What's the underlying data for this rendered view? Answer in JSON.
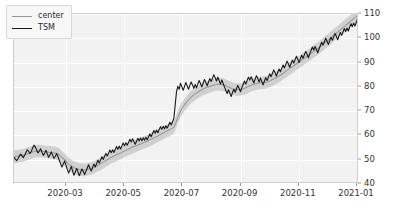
{
  "chart_data": {
    "type": "line",
    "title": "",
    "xlabel": "",
    "ylabel": "",
    "ylim": [
      40,
      110
    ],
    "yticks": [
      40,
      50,
      60,
      70,
      80,
      90,
      100,
      110
    ],
    "xticks": [
      "2020-03",
      "2020-05",
      "2020-07",
      "2020-09",
      "2020-11",
      "2021-01"
    ],
    "grid": true,
    "legend_position": "upper left",
    "legend": [
      "center",
      "TSM"
    ],
    "colors": {
      "center_line": "#9a9a9a",
      "series_line": "#1a1a1a",
      "band_fill": "#b4b4b4",
      "plot_background": "#f2f2f2",
      "grid_line": "#ffffff",
      "figure_background": "#ffffff"
    },
    "x_range": [
      "2020-01-27",
      "2021-01-20"
    ],
    "series": [
      {
        "name": "TSM",
        "values": [
          51.0,
          50.2,
          49.6,
          50.4,
          51.5,
          52.3,
          51.6,
          50.8,
          51.9,
          53.0,
          54.1,
          53.4,
          52.6,
          53.5,
          54.8,
          56.0,
          55.2,
          54.0,
          52.8,
          53.6,
          54.5,
          53.1,
          51.8,
          52.6,
          53.9,
          52.4,
          51.0,
          52.0,
          53.2,
          51.9,
          50.6,
          51.4,
          52.5,
          51.2,
          49.8,
          48.4,
          47.0,
          48.2,
          49.5,
          47.8,
          46.0,
          44.5,
          45.8,
          47.2,
          45.4,
          43.6,
          44.9,
          46.4,
          45.0,
          43.4,
          44.8,
          46.2,
          45.1,
          43.9,
          45.2,
          46.6,
          47.9,
          46.5,
          45.3,
          46.8,
          48.2,
          47.0,
          48.4,
          49.8,
          48.6,
          49.9,
          51.2,
          50.1,
          51.4,
          52.6,
          51.5,
          52.8,
          54.0,
          52.9,
          54.1,
          53.0,
          54.2,
          55.4,
          54.3,
          55.6,
          54.4,
          55.7,
          56.9,
          55.8,
          57.0,
          56.0,
          57.2,
          58.4,
          57.3,
          58.6,
          57.5,
          56.4,
          57.6,
          58.8,
          57.7,
          58.9,
          57.8,
          59.0,
          58.0,
          59.2,
          58.2,
          59.4,
          60.6,
          59.5,
          60.8,
          62.0,
          60.9,
          62.2,
          61.1,
          62.4,
          63.6,
          62.5,
          63.8,
          62.7,
          64.0,
          63.0,
          64.2,
          65.4,
          64.3,
          65.6,
          67.0,
          72.5,
          78.0,
          80.2,
          79.0,
          81.5,
          80.0,
          78.6,
          80.1,
          81.8,
          80.4,
          79.0,
          80.6,
          82.0,
          80.8,
          79.4,
          81.0,
          79.6,
          81.2,
          82.6,
          81.4,
          80.0,
          81.6,
          83.0,
          81.8,
          80.4,
          82.0,
          83.4,
          82.2,
          83.6,
          85.0,
          83.8,
          82.4,
          84.0,
          82.6,
          81.2,
          82.8,
          81.4,
          80.0,
          78.6,
          77.2,
          78.8,
          77.4,
          76.0,
          77.6,
          79.0,
          77.8,
          79.2,
          80.6,
          79.4,
          78.0,
          79.6,
          81.0,
          82.4,
          81.2,
          82.6,
          84.0,
          82.8,
          84.2,
          83.0,
          81.6,
          83.2,
          84.6,
          83.4,
          82.0,
          83.6,
          82.2,
          80.8,
          82.4,
          83.8,
          82.6,
          84.0,
          85.4,
          84.2,
          85.6,
          87.0,
          85.8,
          84.4,
          86.0,
          87.4,
          86.2,
          87.6,
          89.0,
          87.8,
          89.2,
          90.6,
          89.4,
          88.0,
          89.6,
          91.0,
          89.8,
          91.2,
          92.6,
          91.4,
          90.0,
          91.6,
          93.0,
          91.8,
          93.2,
          94.6,
          93.4,
          92.0,
          93.6,
          95.0,
          96.4,
          95.2,
          96.6,
          95.4,
          94.0,
          95.6,
          97.0,
          98.4,
          97.2,
          98.6,
          100.0,
          98.8,
          97.4,
          99.0,
          100.4,
          99.2,
          100.6,
          102.0,
          100.8,
          99.4,
          101.0,
          102.4,
          101.2,
          102.6,
          104.0,
          102.8,
          104.2,
          103.0,
          104.6,
          106.0,
          104.8,
          106.2,
          105.0,
          106.6,
          108.0,
          109.2
        ]
      },
      {
        "name": "center",
        "values": [
          51.2,
          51.3,
          51.4,
          51.5,
          51.6,
          51.7,
          51.8,
          51.9,
          52.0,
          52.2,
          52.4,
          52.6,
          52.8,
          53.0,
          53.2,
          53.4,
          53.5,
          53.6,
          53.6,
          53.6,
          53.6,
          53.5,
          53.4,
          53.3,
          53.3,
          53.2,
          53.1,
          53.0,
          53.0,
          52.9,
          52.8,
          52.7,
          52.6,
          52.4,
          52.0,
          51.5,
          51.0,
          50.5,
          50.0,
          49.4,
          48.8,
          48.2,
          47.8,
          47.5,
          47.1,
          46.7,
          46.5,
          46.4,
          46.2,
          46.0,
          45.9,
          45.9,
          45.8,
          45.8,
          45.9,
          46.0,
          46.2,
          46.3,
          46.4,
          46.6,
          46.9,
          47.1,
          47.4,
          47.8,
          48.0,
          48.3,
          48.7,
          49.0,
          49.3,
          49.7,
          50.0,
          50.3,
          50.7,
          51.0,
          51.3,
          51.5,
          51.8,
          52.1,
          52.3,
          52.6,
          52.8,
          53.1,
          53.4,
          53.6,
          53.9,
          54.1,
          54.4,
          54.7,
          54.9,
          55.2,
          55.4,
          55.6,
          55.8,
          56.1,
          56.3,
          56.5,
          56.7,
          57.0,
          57.2,
          57.4,
          57.6,
          57.9,
          58.2,
          58.4,
          58.7,
          59.0,
          59.3,
          59.6,
          59.8,
          60.1,
          60.4,
          60.7,
          61.0,
          61.3,
          61.6,
          61.8,
          62.1,
          62.4,
          62.7,
          63.0,
          63.5,
          64.5,
          66.0,
          67.5,
          68.8,
          70.0,
          71.0,
          71.8,
          72.6,
          73.4,
          74.0,
          74.6,
          75.2,
          75.8,
          76.3,
          76.7,
          77.1,
          77.5,
          77.8,
          78.2,
          78.5,
          78.8,
          79.1,
          79.4,
          79.6,
          79.8,
          80.0,
          80.2,
          80.4,
          80.6,
          80.8,
          80.9,
          81.0,
          81.1,
          81.1,
          81.0,
          81.0,
          80.9,
          80.7,
          80.5,
          80.2,
          80.0,
          79.7,
          79.4,
          79.2,
          79.1,
          79.0,
          78.9,
          78.9,
          78.9,
          78.9,
          79.0,
          79.2,
          79.4,
          79.6,
          79.9,
          80.2,
          80.4,
          80.7,
          80.9,
          81.0,
          81.2,
          81.4,
          81.5,
          81.6,
          81.7,
          81.7,
          81.7,
          81.8,
          81.9,
          82.0,
          82.2,
          82.4,
          82.7,
          83.0,
          83.3,
          83.6,
          83.8,
          84.1,
          84.5,
          84.8,
          85.2,
          85.6,
          86.0,
          86.4,
          86.8,
          87.2,
          87.5,
          87.9,
          88.3,
          88.7,
          89.1,
          89.5,
          89.9,
          90.2,
          90.6,
          91.0,
          91.4,
          91.8,
          92.2,
          92.6,
          92.9,
          93.3,
          93.7,
          94.2,
          94.6,
          95.0,
          95.4,
          95.7,
          96.1,
          96.6,
          97.1,
          97.5,
          98.0,
          98.5,
          98.9,
          99.3,
          99.8,
          100.3,
          100.7,
          101.2,
          101.7,
          102.1,
          102.5,
          103.0,
          103.5,
          103.9,
          104.4,
          104.9,
          105.3,
          105.8,
          106.2,
          106.7,
          107.2,
          107.6,
          108.1,
          108.5,
          109.0,
          109.5,
          110.0
        ]
      }
    ],
    "band": {
      "name": "center-band",
      "description": "shaded envelope around center line",
      "half_width": 2.6
    }
  }
}
